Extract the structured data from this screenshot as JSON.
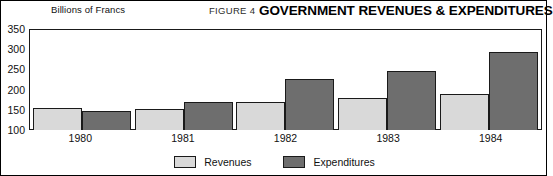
{
  "header": {
    "axis_unit": "Billions of Francs",
    "figure_number": "FIGURE 4",
    "title": "GOVERNMENT REVENUES & EXPENDITURES"
  },
  "legend": {
    "items": [
      {
        "label": "Revenues",
        "color": "#d9d9d9"
      },
      {
        "label": "Expenditures",
        "color": "#6e6e6e"
      }
    ]
  },
  "yticks": [
    "350",
    "300",
    "250",
    "200",
    "150",
    "100"
  ],
  "chart_data": {
    "type": "bar",
    "title": "GOVERNMENT REVENUES & EXPENDITURES",
    "xlabel": "",
    "ylabel": "Billions of Francs",
    "ylim": [
      100,
      350
    ],
    "yticks": [
      100,
      150,
      200,
      250,
      300,
      350
    ],
    "grid": false,
    "legend_position": "bottom-center",
    "categories": [
      "1980",
      "1981",
      "1982",
      "1983",
      "1984"
    ],
    "series": [
      {
        "name": "Revenues",
        "color": "#d9d9d9",
        "values": [
          155,
          152,
          170,
          180,
          192
        ]
      },
      {
        "name": "Expenditures",
        "color": "#6e6e6e",
        "values": [
          147,
          172,
          228,
          248,
          296
        ]
      }
    ]
  }
}
